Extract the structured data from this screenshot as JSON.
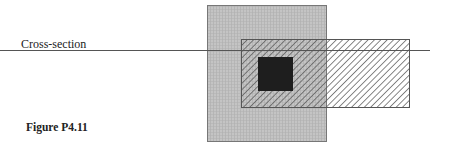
{
  "diagram": {
    "labels": {
      "cross_section": "Cross-section",
      "caption": "Figure P4.11"
    },
    "shapes": [
      {
        "id": "gray-region",
        "fill": "crosshatch-gray",
        "x": 207,
        "y": 5,
        "w": 119,
        "h": 136
      },
      {
        "id": "hatched-region",
        "fill": "diagonal-hatch",
        "x": 241,
        "y": 39,
        "w": 168,
        "h": 68
      },
      {
        "id": "black-square",
        "fill": "#1e1e1e",
        "x": 258,
        "y": 57,
        "w": 35,
        "h": 34
      }
    ],
    "cross_section_line": {
      "x1": 0,
      "y1": 50,
      "x2": 430,
      "y2": 50
    },
    "colors": {
      "gray_fill": "#b9b9b9",
      "hatch_line": "#555555",
      "outline": "#555555",
      "black_fill": "#1e1e1e"
    }
  }
}
